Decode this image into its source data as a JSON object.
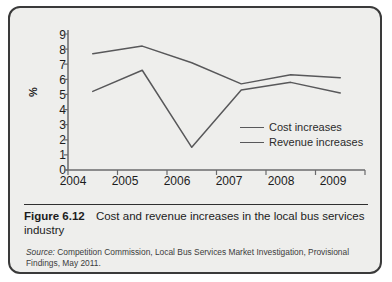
{
  "figure": {
    "number_label": "Figure 6.12",
    "caption": "Cost and revenue increases in the local bus services industry",
    "source_prefix": "Source:",
    "source_text": " Competition Commission, Local Bus Services Market Investigation, Provisional Findings, May 2011."
  },
  "chart_data": {
    "type": "line",
    "title": "Cost and revenue increases in the local bus services industry",
    "xlabel": "",
    "ylabel": "%",
    "categories": [
      "2004",
      "2005",
      "2006",
      "2007",
      "2008",
      "2009"
    ],
    "x": [
      2004,
      2005,
      2006,
      2007,
      2008,
      2009
    ],
    "ylim": [
      0,
      9
    ],
    "yticks": [
      0,
      1,
      2,
      3,
      4,
      5,
      6,
      7,
      8,
      9
    ],
    "ytick_labels": [
      "0",
      "1",
      "2",
      "3",
      "4",
      "5",
      "6",
      "7",
      "8",
      "9"
    ],
    "grid": false,
    "legend_position": "inside lower right",
    "series": [
      {
        "name": "Cost increases",
        "color": "#58585a",
        "values": [
          7.7,
          8.2,
          7.1,
          5.7,
          6.3,
          6.1
        ]
      },
      {
        "name": "Revenue increases",
        "color": "#58585a",
        "values": [
          5.2,
          6.6,
          1.5,
          5.3,
          5.8,
          5.1
        ]
      }
    ]
  },
  "legend": {
    "items": [
      {
        "label": "Cost increases"
      },
      {
        "label": "Revenue increases"
      }
    ]
  },
  "colors": {
    "card_background": "#eeeeec",
    "card_border": "#3a3a3a",
    "axis": "#6a6a6c",
    "line": "#58585a",
    "text": "#1c1c1c"
  }
}
